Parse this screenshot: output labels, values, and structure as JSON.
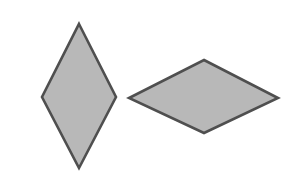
{
  "figure": {
    "title": "Two gray rhombus shapes",
    "canvas": {
      "width": 300,
      "height": 182,
      "background_color": "#ffffff"
    },
    "style": {
      "fill_color": "#b8b8b8",
      "stroke_color": "#4f4f4f",
      "stroke_width": 2.6
    },
    "shapes": [
      {
        "name": "vertical-rhombus",
        "label": "Tall rhombus (vertical long diagonal)",
        "points": "79,24 116,97 79,168 42,97",
        "vertices": {
          "top": [
            79,
            24
          ],
          "right": [
            116,
            97
          ],
          "bottom": [
            79,
            168
          ],
          "left": [
            42,
            97
          ]
        },
        "horizontal_diagonal": 74,
        "vertical_diagonal": 144,
        "fill_color": "#b8b8b8",
        "stroke_color": "#4f4f4f"
      },
      {
        "name": "horizontal-rhombus",
        "label": "Wide rhombus (horizontal long diagonal)",
        "points": "204,60 278,98 204,133 129,98",
        "vertices": {
          "top": [
            204,
            60
          ],
          "right": [
            278,
            98
          ],
          "bottom": [
            204,
            133
          ],
          "left": [
            129,
            98
          ]
        },
        "horizontal_diagonal": 149,
        "vertical_diagonal": 73,
        "fill_color": "#b8b8b8",
        "stroke_color": "#4f4f4f"
      }
    ]
  }
}
